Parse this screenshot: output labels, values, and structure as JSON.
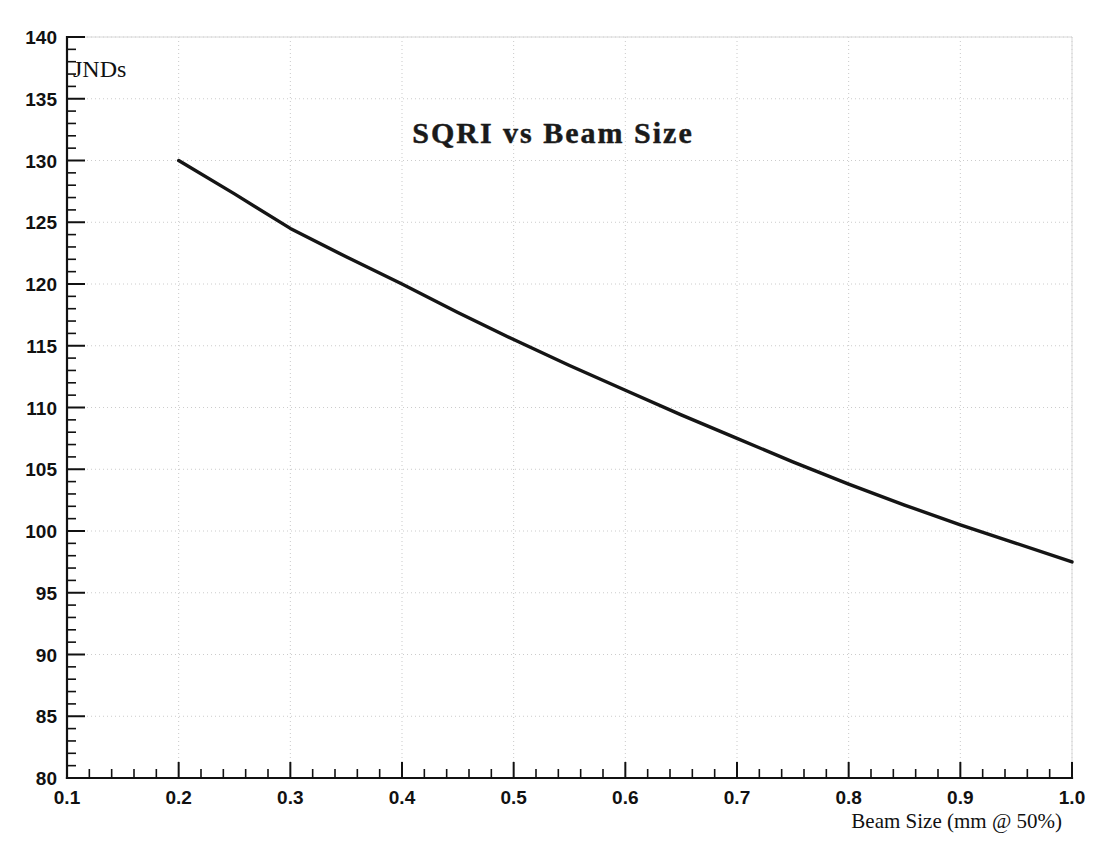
{
  "chart_data": {
    "type": "line",
    "title": "SQRI vs Beam Size",
    "xlabel": "Beam Size (mm @ 50%)",
    "ylabel": "JNDs",
    "xlim": [
      0.1,
      1.0
    ],
    "ylim": [
      80,
      140
    ],
    "grid": true,
    "legend": null,
    "x_ticks": [
      0.1,
      0.2,
      0.3,
      0.4,
      0.5,
      0.6,
      0.7,
      0.8,
      0.9,
      1.0
    ],
    "x_tick_labels": [
      "0.1",
      "0.2",
      "0.3",
      "0.4",
      "0.5",
      "0.6",
      "0.7",
      "0.8",
      "0.9",
      "1.0"
    ],
    "x_minor_tick_step": 0.02,
    "y_ticks": [
      80,
      85,
      90,
      95,
      100,
      105,
      110,
      115,
      120,
      125,
      130,
      135,
      140
    ],
    "y_tick_labels": [
      "80",
      "85",
      "90",
      "95",
      "100",
      "105",
      "110",
      "115",
      "120",
      "125",
      "130",
      "135",
      "140"
    ],
    "y_minor_tick_step": 1,
    "series": [
      {
        "name": "SQRI",
        "color": "#151515",
        "x": [
          0.2,
          0.25,
          0.3,
          0.35,
          0.4,
          0.45,
          0.5,
          0.55,
          0.6,
          0.65,
          0.7,
          0.75,
          0.8,
          0.85,
          0.9,
          0.95,
          1.0
        ],
        "y": [
          130.0,
          127.3,
          124.5,
          122.2,
          120.0,
          117.7,
          115.5,
          113.4,
          111.4,
          109.4,
          107.5,
          105.6,
          103.8,
          102.1,
          100.5,
          99.0,
          97.5
        ]
      }
    ]
  },
  "labels": {
    "title": "SQRI vs Beam Size",
    "y_unit": "JNDs",
    "x_axis_title": "Beam Size (mm @ 50%)"
  },
  "colors": {
    "curve": "#151515",
    "axis": "#111111",
    "grid": "#cccccc",
    "background": "#ffffff"
  }
}
